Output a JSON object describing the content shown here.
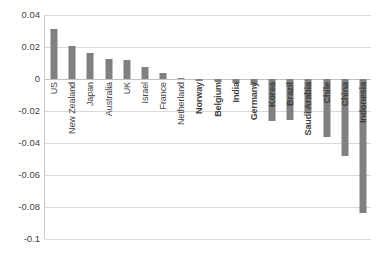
{
  "chart_data": {
    "type": "bar",
    "title": "",
    "subtitle": "",
    "xlabel": "",
    "ylabel": "",
    "ylim": [
      -0.1,
      0.04
    ],
    "ytick_values": [
      0.04,
      0.02,
      0,
      -0.02,
      -0.04,
      -0.06,
      -0.08,
      -0.1
    ],
    "ytick_labels": [
      "0.04",
      "0.02",
      "0",
      "-0.02",
      "-0.04",
      "-0.06",
      "-0.08",
      "-0.1"
    ],
    "grid": true,
    "legend": false,
    "orientation": "vertical",
    "bar_color": "#808080",
    "gridline_color": "#d9d9d9",
    "axis_color": "#c8c8c8",
    "categories": [
      "US",
      "New Zealand",
      "Japan",
      "Australia",
      "UK",
      "Israel",
      "France",
      "Netherland",
      "Norway",
      "Belgium",
      "India",
      "Germany",
      "Korea",
      "Brazil",
      "Saudi Arabia",
      "Chile",
      "China",
      "Indonesia"
    ],
    "values": [
      0.0315,
      0.0205,
      0.016,
      0.0125,
      0.012,
      0.0072,
      0.0038,
      0.0008,
      -0.0012,
      -0.002,
      -0.0028,
      -0.0035,
      -0.0262,
      -0.0258,
      -0.0215,
      -0.036,
      -0.048,
      -0.0835
    ]
  }
}
